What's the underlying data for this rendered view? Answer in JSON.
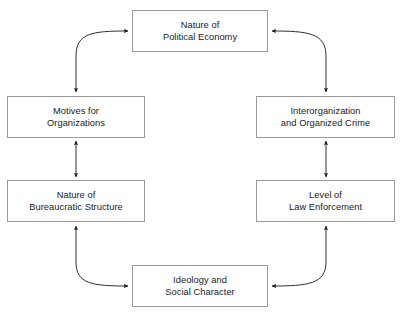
{
  "diagram": {
    "type": "cyclical-flow-diagram",
    "title": "",
    "colors": {
      "box_border": "#9a9a9a",
      "box_fill": "#ffffff",
      "arrow": "#1a1a1a",
      "text": "#1a1a1a",
      "page_background": "#ffffff"
    },
    "nodes": [
      {
        "id": "political-economy",
        "lines": [
          "Nature of",
          "Political Economy"
        ],
        "position": "top-center"
      },
      {
        "id": "motives",
        "lines": [
          "Motives for",
          "Organizations"
        ],
        "position": "upper-left"
      },
      {
        "id": "interorganization",
        "lines": [
          "Interorganization",
          "and Organized Crime"
        ],
        "position": "upper-right"
      },
      {
        "id": "bureaucratic",
        "lines": [
          "Nature of",
          "Bureaucratic Structure"
        ],
        "position": "lower-left"
      },
      {
        "id": "law-enforcement",
        "lines": [
          "Level of",
          "Law Enforcement"
        ],
        "position": "lower-right"
      },
      {
        "id": "ideology",
        "lines": [
          "Ideology and",
          "Social Character"
        ],
        "position": "bottom-center"
      }
    ],
    "edges": [
      {
        "id": "political-economy--motives",
        "from": "political-economy",
        "to": "motives",
        "style": "curved",
        "arrowheads": "both"
      },
      {
        "id": "political-economy--interorganization",
        "from": "political-economy",
        "to": "interorganization",
        "style": "curved",
        "arrowheads": "both"
      },
      {
        "id": "motives--bureaucratic",
        "from": "motives",
        "to": "bureaucratic",
        "style": "straight-vertical",
        "arrowheads": "both"
      },
      {
        "id": "interorganization--law-enforcement",
        "from": "interorganization",
        "to": "law-enforcement",
        "style": "straight-vertical",
        "arrowheads": "both"
      },
      {
        "id": "bureaucratic--ideology",
        "from": "bureaucratic",
        "to": "ideology",
        "style": "curved",
        "arrowheads": "both"
      },
      {
        "id": "law-enforcement--ideology",
        "from": "law-enforcement",
        "to": "ideology",
        "style": "curved",
        "arrowheads": "both"
      }
    ]
  }
}
